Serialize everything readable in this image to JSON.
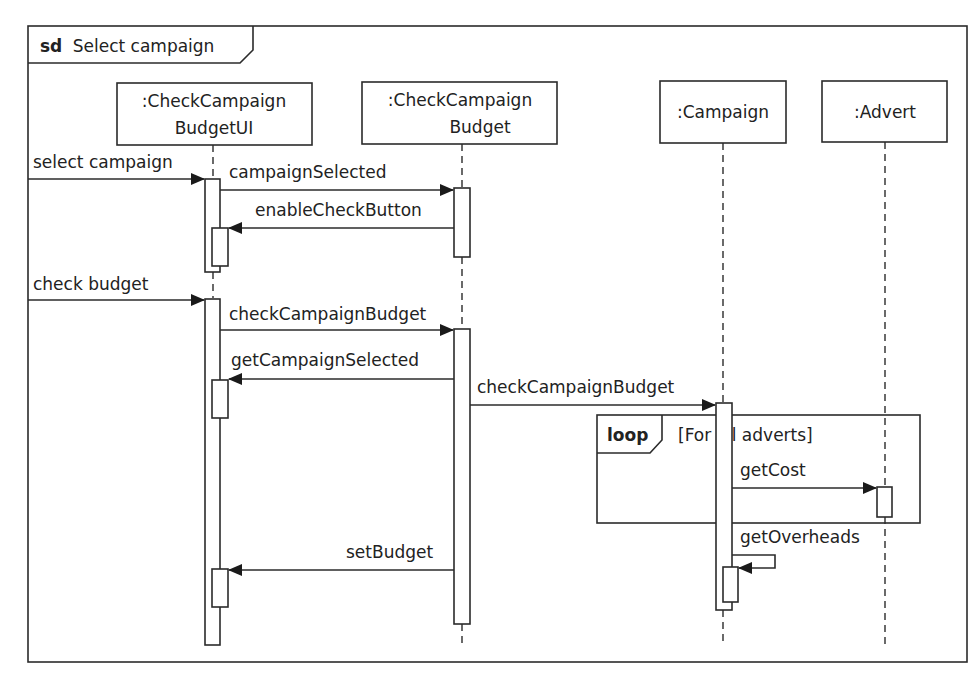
{
  "frame": {
    "keyword": "sd",
    "title": "Select campaign"
  },
  "lifelines": [
    {
      "id": "ui",
      "line1": ":CheckCampaign",
      "line2": "BudgetUI"
    },
    {
      "id": "ccb",
      "line1": ":CheckCampaign",
      "line2": "Budget"
    },
    {
      "id": "campaign",
      "line1": ":Campaign"
    },
    {
      "id": "advert",
      "line1": ":Advert"
    }
  ],
  "messages": [
    {
      "label": "select campaign",
      "from": "actor",
      "to": "ui"
    },
    {
      "label": "campaignSelected",
      "from": "ui",
      "to": "ccb"
    },
    {
      "label": "enableCheckButton",
      "from": "ccb",
      "to": "ui"
    },
    {
      "label": "check budget",
      "from": "actor",
      "to": "ui"
    },
    {
      "label": "checkCampaignBudget",
      "from": "ui",
      "to": "ccb"
    },
    {
      "label": "getCampaignSelected",
      "from": "ccb",
      "to": "ui"
    },
    {
      "label": "checkCampaignBudget",
      "from": "ccb",
      "to": "campaign"
    },
    {
      "label": "getCost",
      "from": "campaign",
      "to": "advert"
    },
    {
      "label": "getOverheads",
      "from": "campaign",
      "to": "campaign"
    },
    {
      "label": "setBudget",
      "from": "ccb",
      "to": "ui"
    }
  ],
  "fragment": {
    "operator": "loop",
    "guard": "[For all adverts]"
  },
  "colors": {
    "line": "#2b2b2b",
    "background": "#ffffff"
  }
}
